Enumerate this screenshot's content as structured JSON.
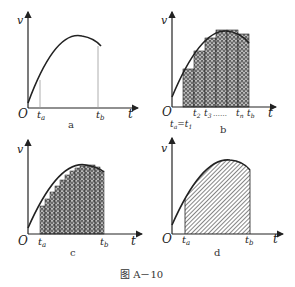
{
  "figure": {
    "caption": "图 A－10",
    "panels": [
      {
        "id": "a",
        "label": "a",
        "y_axis": "v",
        "x_axis": "t",
        "origin": "O",
        "ticks": [
          "t",
          "t"
        ],
        "tick_subs": [
          "a",
          "b"
        ],
        "fill": "none"
      },
      {
        "id": "b",
        "label": "b",
        "y_axis": "v",
        "x_axis": "t",
        "origin": "O",
        "ticks": [
          "t",
          "t",
          "t",
          "t"
        ],
        "tick_subs": [
          "2",
          "3",
          "n",
          "b"
        ],
        "dots": "……",
        "lower_label": "t",
        "lower_sub1": "a",
        "lower_eq": "=t",
        "lower_sub2": "1",
        "fill": "rectangles (coarse)"
      },
      {
        "id": "c",
        "label": "c",
        "y_axis": "v",
        "x_axis": "t",
        "origin": "O",
        "ticks": [
          "t",
          "t"
        ],
        "tick_subs": [
          "a",
          "b"
        ],
        "fill": "rectangles (fine)"
      },
      {
        "id": "d",
        "label": "d",
        "y_axis": "v",
        "x_axis": "t",
        "origin": "O",
        "ticks": [
          "t",
          "t"
        ],
        "tick_subs": [
          "a",
          "b"
        ],
        "fill": "area under curve"
      }
    ]
  },
  "colors": {
    "ink": "#222222",
    "hatch": "#444444",
    "guide": "#999999"
  }
}
